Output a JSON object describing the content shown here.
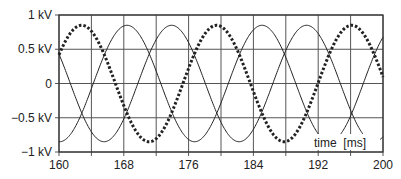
{
  "chart_data": {
    "type": "line",
    "title": "",
    "xlabel": "time  [ms]",
    "ylabel": "",
    "xlim": [
      160,
      200
    ],
    "ylim": [
      -1,
      1
    ],
    "x_ticks": [
      160,
      168,
      176,
      184,
      192,
      200
    ],
    "x_minor_grid": [
      164,
      172,
      180,
      188,
      196
    ],
    "y_ticks": [
      {
        "value": 1,
        "label": "1 kV"
      },
      {
        "value": 0.5,
        "label": "0.5 kV"
      },
      {
        "value": 0,
        "label": "0"
      },
      {
        "value": -0.5,
        "label": "−0.5 kV"
      },
      {
        "value": -1,
        "label": "−1 kV"
      }
    ],
    "grid": true,
    "legend": null,
    "series": [
      {
        "name": "phase-a (dashed)",
        "style": "dashed",
        "amplitude_kV": 0.85,
        "frequency_Hz": 60,
        "peak_time_ms": 162.8
      },
      {
        "name": "phase-b",
        "style": "solid",
        "amplitude_kV": 0.85,
        "frequency_Hz": 60,
        "peak_time_ms": 168.4
      },
      {
        "name": "phase-c",
        "style": "solid",
        "amplitude_kV": 0.85,
        "frequency_Hz": 60,
        "peak_time_ms": 173.9
      }
    ]
  },
  "labels": {
    "xlabel": "time  [ms]"
  }
}
